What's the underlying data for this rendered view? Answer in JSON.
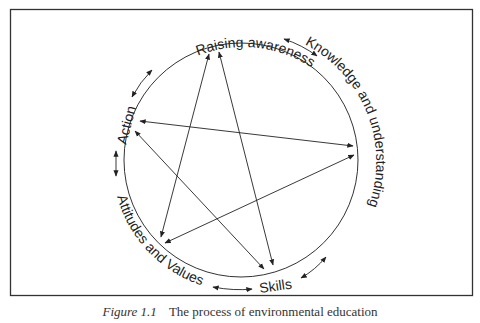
{
  "diagram": {
    "type": "cycle-diagram",
    "frame": {
      "x": 10,
      "y": 9,
      "width": 463,
      "height": 287,
      "stroke": "#333333"
    },
    "circle": {
      "cx": 241,
      "cy": 160,
      "r": 117,
      "stroke": "#333333"
    },
    "nodes": [
      {
        "id": "raising",
        "label": "Raising awareness"
      },
      {
        "id": "knowledge",
        "label": "Knowledge and understanding"
      },
      {
        "id": "skills",
        "label": "Skills"
      },
      {
        "id": "attitudes",
        "label": "Attitudes and Values"
      },
      {
        "id": "action",
        "label": "Action"
      }
    ],
    "outer_arrows": [
      {
        "from": "raising",
        "to": "knowledge",
        "bidirectional": true
      },
      {
        "from": "knowledge",
        "to": "skills",
        "bidirectional": true
      },
      {
        "from": "skills",
        "to": "attitudes",
        "bidirectional": true
      },
      {
        "from": "attitudes",
        "to": "action",
        "bidirectional": true
      },
      {
        "from": "action",
        "to": "raising",
        "bidirectional": true
      }
    ],
    "inner_arrows": [
      {
        "from": "raising",
        "to": "attitudes",
        "bidirectional": true
      },
      {
        "from": "raising",
        "to": "skills",
        "bidirectional": true
      },
      {
        "from": "action",
        "to": "knowledge",
        "bidirectional": true
      },
      {
        "from": "action",
        "to": "skills",
        "bidirectional": true
      },
      {
        "from": "knowledge",
        "to": "attitudes",
        "bidirectional": true
      }
    ]
  },
  "caption": {
    "label": "Figure 1.1",
    "text": "The process of environmental education"
  }
}
